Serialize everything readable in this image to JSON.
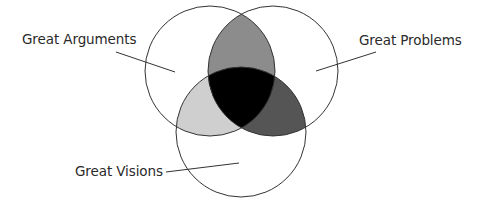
{
  "diagram": {
    "type": "venn",
    "sets": [
      {
        "id": "arguments",
        "label": "Great Arguments"
      },
      {
        "id": "problems",
        "label": "Great Problems"
      },
      {
        "id": "visions",
        "label": "Great Visions"
      }
    ],
    "colors": {
      "background": "#ffffff",
      "outline": "#333333",
      "arguments_problems": "#8c8c8c",
      "arguments_visions": "#cfcfcf",
      "problems_visions": "#555555",
      "all_three": "#000000",
      "leader_line": "#333333"
    }
  }
}
